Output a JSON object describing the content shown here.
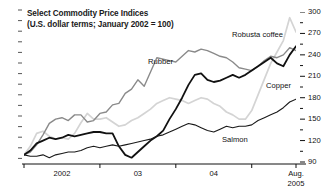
{
  "chart_data": {
    "type": "line",
    "title": "Select Commodity Price Indices",
    "subtitle": "(U.S. dollar terms; January 2002 = 100)",
    "xlabel": "",
    "ylabel": "",
    "ylim": [
      90,
      300
    ],
    "ytick_values": [
      300,
      270,
      240,
      210,
      180,
      150,
      120,
      90
    ],
    "ytick_labels": [
      "300",
      "270",
      "240",
      "210",
      "180",
      "150",
      "120",
      "90"
    ],
    "y_minor_step": 15,
    "y_axis_position": "right",
    "grid": false,
    "legend_position": "inline-labels",
    "xtick_labels": [
      "2002",
      "03",
      "04",
      "Aug."
    ],
    "x_end_label_line2": "2005",
    "x": [
      "2002-01",
      "2002-02",
      "2002-03",
      "2002-04",
      "2002-05",
      "2002-06",
      "2002-07",
      "2002-08",
      "2002-09",
      "2002-10",
      "2002-11",
      "2002-12",
      "2003-01",
      "2003-02",
      "2003-03",
      "2003-04",
      "2003-05",
      "2003-06",
      "2003-07",
      "2003-08",
      "2003-09",
      "2003-10",
      "2003-11",
      "2003-12",
      "2004-01",
      "2004-02",
      "2004-03",
      "2004-04",
      "2004-05",
      "2004-06",
      "2004-07",
      "2004-08",
      "2004-09",
      "2004-10",
      "2004-11",
      "2004-12",
      "2005-01",
      "2005-02",
      "2005-03",
      "2005-04",
      "2005-05",
      "2005-06",
      "2005-07",
      "2005-08"
    ],
    "series": [
      {
        "name": "Robusta coffee",
        "color": "#d4d4d4",
        "width": 1.7,
        "label_x": 232,
        "label_y": 30,
        "values": [
          100,
          112,
          130,
          133,
          126,
          122,
          124,
          122,
          130,
          145,
          158,
          150,
          150,
          152,
          146,
          140,
          142,
          148,
          152,
          158,
          164,
          172,
          176,
          180,
          178,
          176,
          172,
          176,
          180,
          178,
          172,
          168,
          160,
          156,
          150,
          150,
          162,
          184,
          206,
          228,
          244,
          260,
          292,
          272
        ]
      },
      {
        "name": "Rubber",
        "color": "#8a8a8a",
        "width": 1.4,
        "label_x": 148,
        "label_y": 57,
        "values": [
          100,
          104,
          114,
          128,
          144,
          150,
          152,
          148,
          156,
          156,
          146,
          148,
          158,
          160,
          170,
          172,
          186,
          192,
          205,
          196,
          216,
          236,
          234,
          232,
          230,
          238,
          246,
          244,
          248,
          246,
          242,
          238,
          236,
          230,
          222,
          220,
          218,
          224,
          232,
          238,
          236,
          240,
          250,
          246
        ]
      },
      {
        "name": "Copper",
        "color": "#111111",
        "width": 1.8,
        "label_x": 266,
        "label_y": 81,
        "values": [
          100,
          106,
          116,
          120,
          124,
          122,
          124,
          128,
          126,
          128,
          130,
          132,
          132,
          130,
          130,
          112,
          100,
          96,
          104,
          112,
          120,
          126,
          134,
          150,
          164,
          180,
          198,
          212,
          214,
          205,
          202,
          204,
          208,
          212,
          208,
          212,
          218,
          224,
          230,
          236,
          228,
          224,
          240,
          252
        ]
      },
      {
        "name": "Salmon",
        "color": "#1a1a1a",
        "width": 1.1,
        "label_x": 222,
        "label_y": 135,
        "values": [
          100,
          98,
          98,
          100,
          96,
          100,
          102,
          104,
          104,
          106,
          110,
          112,
          110,
          112,
          114,
          112,
          114,
          116,
          118,
          120,
          122,
          126,
          128,
          132,
          136,
          140,
          144,
          142,
          138,
          134,
          132,
          136,
          140,
          138,
          140,
          140,
          142,
          148,
          152,
          156,
          160,
          166,
          174,
          178
        ]
      }
    ]
  }
}
